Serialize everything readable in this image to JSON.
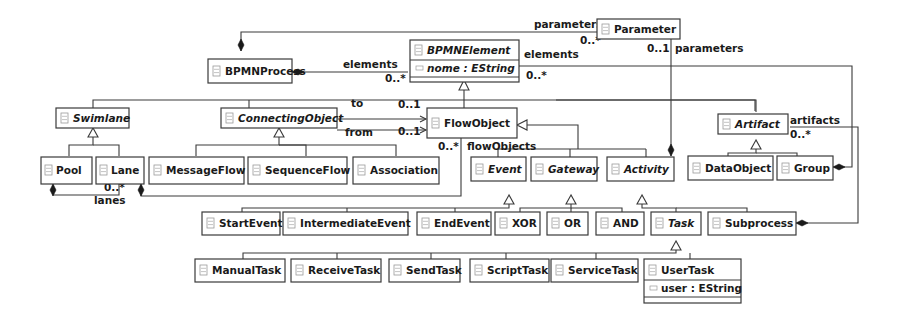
{
  "diagram": {
    "type": "UML class diagram (BPMN metamodel)",
    "classes": {
      "bpmnprocess": {
        "name": "BPMNProcess",
        "abstract": false
      },
      "bpmnelement": {
        "name": "BPMNElement",
        "abstract": true,
        "attr": "nome : EString"
      },
      "parameter": {
        "name": "Parameter",
        "abstract": false
      },
      "swimlane": {
        "name": "Swimlane",
        "abstract": true
      },
      "connectingobject": {
        "name": "ConnectingObject",
        "abstract": true
      },
      "flowobject": {
        "name": "FlowObject",
        "abstract": false
      },
      "artifact": {
        "name": "Artifact",
        "abstract": true
      },
      "pool": {
        "name": "Pool",
        "abstract": false
      },
      "lane": {
        "name": "Lane",
        "abstract": false
      },
      "messageflow": {
        "name": "MessageFlow",
        "abstract": false
      },
      "sequenceflow": {
        "name": "SequenceFlow",
        "abstract": false
      },
      "association": {
        "name": "Association",
        "abstract": false
      },
      "event": {
        "name": "Event",
        "abstract": true
      },
      "gateway": {
        "name": "Gateway",
        "abstract": true
      },
      "activity": {
        "name": "Activity",
        "abstract": true
      },
      "dataobject": {
        "name": "DataObject",
        "abstract": false
      },
      "group": {
        "name": "Group",
        "abstract": false
      },
      "startevent": {
        "name": "StartEvent",
        "abstract": false
      },
      "intermediateevent": {
        "name": "IntermediateEvent",
        "abstract": false
      },
      "endevent": {
        "name": "EndEvent",
        "abstract": false
      },
      "xor": {
        "name": "XOR",
        "abstract": false
      },
      "or": {
        "name": "OR",
        "abstract": false
      },
      "and": {
        "name": "AND",
        "abstract": false
      },
      "task": {
        "name": "Task",
        "abstract": true
      },
      "subprocess": {
        "name": "Subprocess",
        "abstract": false
      },
      "manualtask": {
        "name": "ManualTask",
        "abstract": false
      },
      "receivetask": {
        "name": "ReceiveTask",
        "abstract": false
      },
      "sendtask": {
        "name": "SendTask",
        "abstract": false
      },
      "scripttask": {
        "name": "ScriptTask",
        "abstract": false
      },
      "servicetask": {
        "name": "ServiceTask",
        "abstract": false
      },
      "usertask": {
        "name": "UserTask",
        "abstract": false,
        "attr": "user : EString"
      }
    },
    "labels": {
      "process_parameters_role": "parameters",
      "process_parameters_mult": "0..*",
      "process_elements_role": "elements",
      "process_elements_mult": "0..*",
      "group_elements_role": "elements",
      "group_elements_mult": "0..*",
      "activity_parameters_mult": "0..1",
      "activity_parameters_role": "parameters",
      "to_role": "to",
      "to_mult": "0..1",
      "from_role": "from",
      "from_mult": "0..1",
      "flowobjects_mult": "0..*",
      "flowobjects_role": "flowObjects",
      "artifacts_role": "artifacts",
      "artifacts_mult": "0..*",
      "lanes_mult": "0..*",
      "lanes_role": "lanes"
    }
  }
}
